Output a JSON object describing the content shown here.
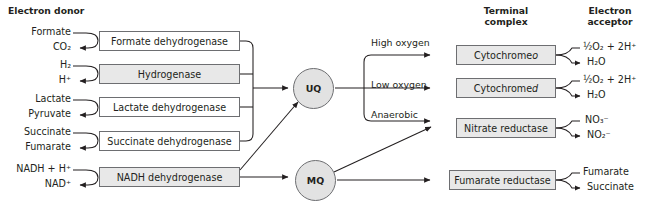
{
  "headers": {
    "electron_donor": "Electron donor",
    "terminal_complex_line1": "Terminal",
    "terminal_complex_line2": "complex",
    "electron_acceptor_line1": "Electron",
    "electron_acceptor_line2": "acceptor"
  },
  "donors": [
    {
      "substrate": "Formate",
      "product": "CO₂",
      "enzyme": "Formate dehydrogenase"
    },
    {
      "substrate": "H₂",
      "product": "H⁺",
      "enzyme": "Hydrogenase"
    },
    {
      "substrate": "Lactate",
      "product": "Pyruvate",
      "enzyme": "Lactate dehydrogenase"
    },
    {
      "substrate": "Succinate",
      "product": "Fumarate",
      "enzyme": "Succinate dehydrogenase"
    },
    {
      "substrate": "NADH + H⁺",
      "product": "NAD⁺",
      "enzyme": "NADH dehydrogenase"
    }
  ],
  "quinones": [
    {
      "id": "uq",
      "label": "UQ"
    },
    {
      "id": "mq",
      "label": "MQ"
    }
  ],
  "conditions": [
    {
      "label": "High oxygen"
    },
    {
      "label": "Low oxygen"
    },
    {
      "label": "Anaerobic"
    }
  ],
  "terminal": [
    {
      "name": "Cytochrome o",
      "italic_tail": "o",
      "base": "Cytochrome ",
      "acceptor_in": "½O₂ + 2H⁺",
      "acceptor_out": "H₂O"
    },
    {
      "name": "Cytochrome d",
      "italic_tail": "d",
      "base": "Cytochrome ",
      "acceptor_in": "½O₂ + 2H⁺",
      "acceptor_out": "H₂O"
    },
    {
      "name": "Nitrate reductase",
      "italic_tail": "",
      "base": "Nitrate reductase",
      "acceptor_in": "NO₃⁻",
      "acceptor_out": "NO₂⁻"
    },
    {
      "name": "Fumarate reductase",
      "italic_tail": "",
      "base": "Fumarate reductase",
      "acceptor_in": "Fumarate",
      "acceptor_out": "Succinate"
    }
  ],
  "colors": {
    "stroke": "#231f20",
    "box_border": "#6d6e71",
    "box_fill_shaded": "#e8e8e8",
    "circle_fill": "#e2e2e2",
    "text": "#231f20",
    "background": "#ffffff"
  }
}
